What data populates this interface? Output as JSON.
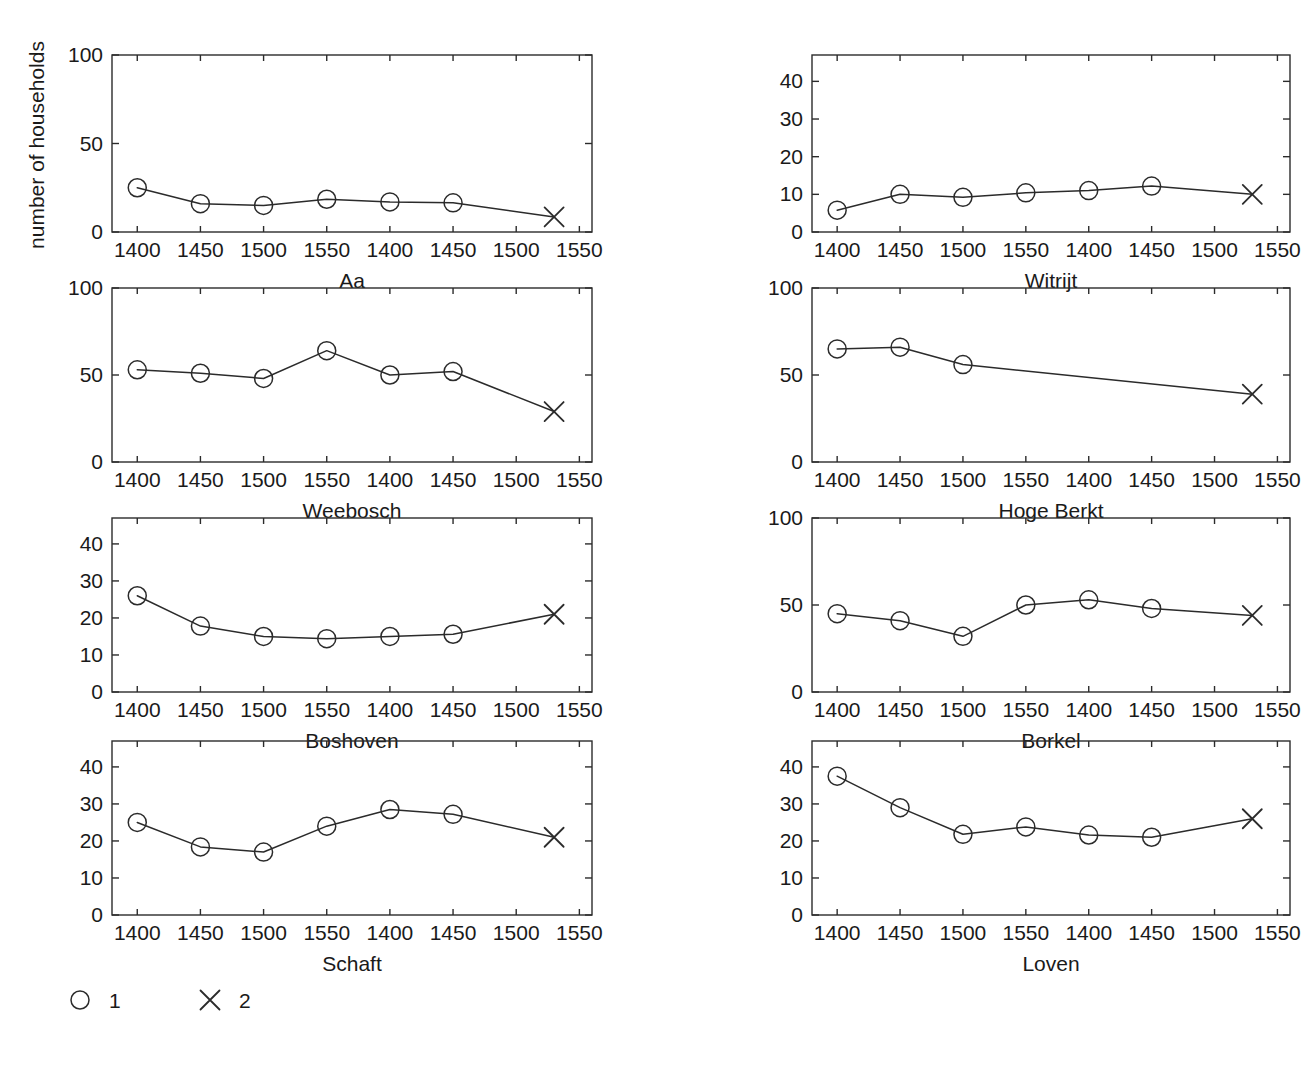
{
  "figure": {
    "ylabel": "number of households",
    "legend": {
      "items": [
        {
          "marker": "circle-marker-icon",
          "label": "1"
        },
        {
          "marker": "x-marker-icon",
          "label": "2"
        }
      ]
    },
    "colors": {
      "ink": "#2b2b2b",
      "background": "#ffffff"
    }
  },
  "chart_data": [
    {
      "type": "line",
      "title": "Aa",
      "xlabel": "Aa",
      "ylabel": "number of households",
      "x": [
        1400,
        1450,
        1500,
        1550,
        1600,
        1650,
        1730
      ],
      "xtick_positions": [
        1400,
        1450,
        1500,
        1550,
        1600,
        1650,
        1700,
        1750
      ],
      "xtick_labels": [
        "1400",
        "1450",
        "1500",
        "1550",
        "1400",
        "1450",
        "1500",
        "1550"
      ],
      "xlim": [
        1380,
        1760
      ],
      "ylim": [
        0,
        100
      ],
      "yticks": [
        0,
        50,
        100
      ],
      "ytick_labels": [
        "0",
        "50",
        "100"
      ],
      "grid": false,
      "series": [
        {
          "name": "1",
          "marker": "circle",
          "x": [
            1400,
            1450,
            1500,
            1550,
            1600,
            1650
          ],
          "values": [
            25,
            16,
            15,
            18.5,
            17,
            16.5
          ]
        },
        {
          "name": "2",
          "marker": "x",
          "x": [
            1730
          ],
          "values": [
            8.5
          ]
        }
      ]
    },
    {
      "type": "line",
      "title": "Witrijt",
      "xlabel": "Witrijt",
      "ylabel": "number of households",
      "x": [
        1400,
        1450,
        1500,
        1550,
        1600,
        1650,
        1730
      ],
      "xtick_positions": [
        1400,
        1450,
        1500,
        1550,
        1600,
        1650,
        1700,
        1750
      ],
      "xtick_labels": [
        "1400",
        "1450",
        "1500",
        "1550",
        "1400",
        "1450",
        "1500",
        "1550"
      ],
      "xlim": [
        1380,
        1760
      ],
      "ylim": [
        0,
        47
      ],
      "yticks": [
        0,
        10,
        20,
        30,
        40
      ],
      "ytick_labels": [
        "0",
        "10",
        "20",
        "30",
        "40"
      ],
      "grid": false,
      "series": [
        {
          "name": "1",
          "marker": "circle",
          "x": [
            1400,
            1450,
            1500,
            1550,
            1600,
            1650
          ],
          "values": [
            5.8,
            10,
            9.2,
            10.4,
            11,
            12.2
          ]
        },
        {
          "name": "2",
          "marker": "x",
          "x": [
            1730
          ],
          "values": [
            10
          ]
        }
      ]
    },
    {
      "type": "line",
      "title": "Weebosch",
      "xlabel": "Weebosch",
      "ylabel": "number of households",
      "x": [
        1400,
        1450,
        1500,
        1550,
        1600,
        1650,
        1730
      ],
      "xtick_positions": [
        1400,
        1450,
        1500,
        1550,
        1600,
        1650,
        1700,
        1750
      ],
      "xtick_labels": [
        "1400",
        "1450",
        "1500",
        "1550",
        "1400",
        "1450",
        "1500",
        "1550"
      ],
      "xlim": [
        1380,
        1760
      ],
      "ylim": [
        0,
        100
      ],
      "yticks": [
        0,
        50,
        100
      ],
      "ytick_labels": [
        "0",
        "50",
        "100"
      ],
      "grid": false,
      "series": [
        {
          "name": "1",
          "marker": "circle",
          "x": [
            1400,
            1450,
            1500,
            1550,
            1600,
            1650
          ],
          "values": [
            53,
            51,
            48,
            64,
            50,
            52
          ]
        },
        {
          "name": "2",
          "marker": "x",
          "x": [
            1730
          ],
          "values": [
            29
          ]
        }
      ]
    },
    {
      "type": "line",
      "title": "Hoge Berkt",
      "xlabel": "Hoge Berkt",
      "ylabel": "number of households",
      "x": [
        1400,
        1450,
        1500,
        1730
      ],
      "xtick_positions": [
        1400,
        1450,
        1500,
        1550,
        1600,
        1650,
        1700,
        1750
      ],
      "xtick_labels": [
        "1400",
        "1450",
        "1500",
        "1550",
        "1400",
        "1450",
        "1500",
        "1550"
      ],
      "xlim": [
        1380,
        1760
      ],
      "ylim": [
        0,
        100
      ],
      "yticks": [
        0,
        50,
        100
      ],
      "ytick_labels": [
        "0",
        "50",
        "100"
      ],
      "grid": false,
      "series": [
        {
          "name": "1",
          "marker": "circle",
          "x": [
            1400,
            1450,
            1500
          ],
          "values": [
            65,
            66,
            56
          ]
        },
        {
          "name": "2",
          "marker": "x",
          "x": [
            1730
          ],
          "values": [
            39
          ]
        }
      ]
    },
    {
      "type": "line",
      "title": "Boshoven",
      "xlabel": "Boshoven",
      "ylabel": "number of households",
      "x": [
        1400,
        1450,
        1500,
        1550,
        1600,
        1650,
        1730
      ],
      "xtick_positions": [
        1400,
        1450,
        1500,
        1550,
        1600,
        1650,
        1700,
        1750
      ],
      "xtick_labels": [
        "1400",
        "1450",
        "1500",
        "1550",
        "1400",
        "1450",
        "1500",
        "1550"
      ],
      "xlim": [
        1380,
        1760
      ],
      "ylim": [
        0,
        47
      ],
      "yticks": [
        0,
        10,
        20,
        30,
        40
      ],
      "ytick_labels": [
        "0",
        "10",
        "20",
        "30",
        "40"
      ],
      "grid": false,
      "series": [
        {
          "name": "1",
          "marker": "circle",
          "x": [
            1400,
            1450,
            1500,
            1550,
            1600,
            1650
          ],
          "values": [
            26,
            17.8,
            15,
            14.4,
            15,
            15.6
          ]
        },
        {
          "name": "2",
          "marker": "x",
          "x": [
            1730
          ],
          "values": [
            21
          ]
        }
      ]
    },
    {
      "type": "line",
      "title": "Borkel",
      "xlabel": "Borkel",
      "ylabel": "number of households",
      "x": [
        1400,
        1450,
        1500,
        1550,
        1600,
        1650,
        1730
      ],
      "xtick_positions": [
        1400,
        1450,
        1500,
        1550,
        1600,
        1650,
        1700,
        1750
      ],
      "xtick_labels": [
        "1400",
        "1450",
        "1500",
        "1550",
        "1400",
        "1450",
        "1500",
        "1550"
      ],
      "xlim": [
        1380,
        1760
      ],
      "ylim": [
        0,
        100
      ],
      "yticks": [
        0,
        50,
        100
      ],
      "ytick_labels": [
        "0",
        "50",
        "100"
      ],
      "grid": false,
      "series": [
        {
          "name": "1",
          "marker": "circle",
          "x": [
            1400,
            1450,
            1500,
            1550,
            1600,
            1650
          ],
          "values": [
            45,
            41,
            32,
            50,
            53,
            48
          ]
        },
        {
          "name": "2",
          "marker": "x",
          "x": [
            1730
          ],
          "values": [
            44
          ]
        }
      ]
    },
    {
      "type": "line",
      "title": "Schaft",
      "xlabel": "Schaft",
      "ylabel": "number of households",
      "x": [
        1400,
        1450,
        1500,
        1550,
        1600,
        1650,
        1730
      ],
      "xtick_positions": [
        1400,
        1450,
        1500,
        1550,
        1600,
        1650,
        1700,
        1750
      ],
      "xtick_labels": [
        "1400",
        "1450",
        "1500",
        "1550",
        "1400",
        "1450",
        "1500",
        "1550"
      ],
      "xlim": [
        1380,
        1760
      ],
      "ylim": [
        0,
        47
      ],
      "yticks": [
        0,
        10,
        20,
        30,
        40
      ],
      "ytick_labels": [
        "0",
        "10",
        "20",
        "30",
        "40"
      ],
      "grid": false,
      "series": [
        {
          "name": "1",
          "marker": "circle",
          "x": [
            1400,
            1450,
            1500,
            1550,
            1600,
            1650
          ],
          "values": [
            25,
            18.4,
            17,
            24,
            28.5,
            27.2
          ]
        },
        {
          "name": "2",
          "marker": "x",
          "x": [
            1730
          ],
          "values": [
            21
          ]
        }
      ]
    },
    {
      "type": "line",
      "title": "Loven",
      "xlabel": "Loven",
      "ylabel": "number of households",
      "x": [
        1400,
        1450,
        1500,
        1550,
        1600,
        1650,
        1730
      ],
      "xtick_positions": [
        1400,
        1450,
        1500,
        1550,
        1600,
        1650,
        1700,
        1750
      ],
      "xtick_labels": [
        "1400",
        "1450",
        "1500",
        "1550",
        "1400",
        "1450",
        "1500",
        "1550"
      ],
      "xlim": [
        1380,
        1760
      ],
      "ylim": [
        0,
        47
      ],
      "yticks": [
        0,
        10,
        20,
        30,
        40
      ],
      "ytick_labels": [
        "0",
        "10",
        "20",
        "30",
        "40"
      ],
      "grid": false,
      "series": [
        {
          "name": "1",
          "marker": "circle",
          "x": [
            1400,
            1450,
            1500,
            1550,
            1600,
            1650
          ],
          "values": [
            37.5,
            29,
            21.8,
            23.8,
            21.6,
            21
          ]
        },
        {
          "name": "2",
          "marker": "x",
          "x": [
            1730
          ],
          "values": [
            26
          ]
        }
      ]
    }
  ],
  "layout": {
    "panels": [
      {
        "key": 0,
        "left": 112,
        "top": 55,
        "width": 480,
        "height": 177
      },
      {
        "key": 1,
        "left": 812,
        "top": 55,
        "width": 478,
        "height": 177
      },
      {
        "key": 2,
        "left": 112,
        "top": 288,
        "width": 480,
        "height": 174
      },
      {
        "key": 3,
        "left": 812,
        "top": 288,
        "width": 478,
        "height": 174
      },
      {
        "key": 4,
        "left": 112,
        "top": 518,
        "width": 480,
        "height": 174
      },
      {
        "key": 5,
        "left": 812,
        "top": 518,
        "width": 478,
        "height": 174
      },
      {
        "key": 6,
        "left": 112,
        "top": 741,
        "width": 480,
        "height": 174
      },
      {
        "key": 7,
        "left": 812,
        "top": 741,
        "width": 478,
        "height": 174
      }
    ],
    "legend": {
      "x": 80,
      "y": 1000
    }
  }
}
